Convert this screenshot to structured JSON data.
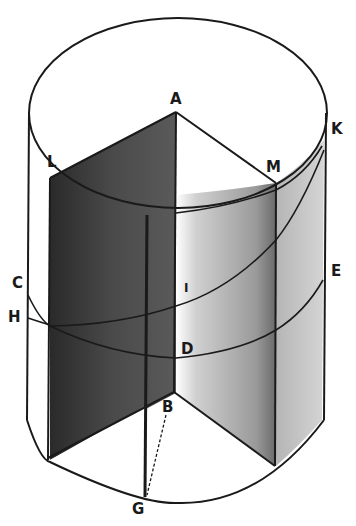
{
  "figure": {
    "colors": {
      "background": "#ffffff",
      "ink": "#1a1a1a",
      "dark_face": "#3a3a3a",
      "mid_face": "#8a8a8a",
      "light_face": "#c4c4c4"
    },
    "labels": {
      "A": "A",
      "K": "K",
      "L": "L",
      "M": "M",
      "C": "C",
      "E": "E",
      "I": "I",
      "H": "H",
      "D": "D",
      "B": "B",
      "G": "G"
    }
  }
}
